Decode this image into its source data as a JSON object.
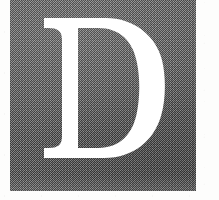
{
  "document": {
    "type": "scanned-page-fragment",
    "background_color": "#fdfdfc",
    "alt_text": "Large white serif capital letter D reversed out of a dark gray textured block"
  },
  "dropcap": {
    "letter": "D",
    "letter_color": "#ffffff",
    "block_color": "#6b6b6b",
    "block_texture": "halftone-dither-grain",
    "typeface_style": "serif",
    "block": {
      "x": 10,
      "y": 0,
      "width": 186,
      "height": 191
    },
    "glyph": {
      "x": 48,
      "y": 18,
      "width": 117,
      "height": 147
    }
  },
  "icons": {
    "paper_grain": "paper-grain-icon",
    "ink_texture": "halftone-texture-icon"
  }
}
